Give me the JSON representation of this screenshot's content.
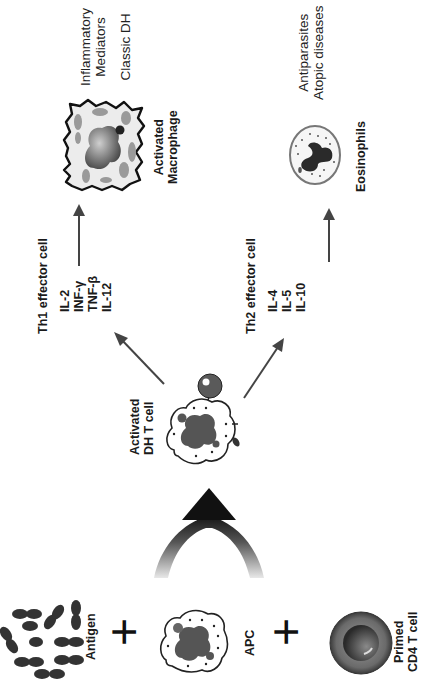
{
  "inputs": {
    "antigen_label": "Antigen",
    "apc_label": "APC",
    "primed_cell_label_line1": "Primed",
    "primed_cell_label_line2": "CD4 T cell",
    "plus_symbol": "+"
  },
  "activation": {
    "cell_label_line1": "Activated",
    "cell_label_line2": "DH T cell"
  },
  "th1": {
    "title": "Th1 effector cell",
    "cytokines": [
      "IL-2",
      "INF-γ",
      "TNF-β",
      "IL-12"
    ],
    "target_label_line1": "Activated",
    "target_label_line2": "Macrophage",
    "outcome_line1": "Inflammatory",
    "outcome_line2": "Mediators",
    "outcome_line3": "Classic DH"
  },
  "th2": {
    "title": "Th2 effector cell",
    "cytokines": [
      "IL-4",
      "IL-5",
      "IL-10"
    ],
    "target_label": "Eosinophils",
    "outcome_line1": "Antiparasites",
    "outcome_line2": "Atopic diseases"
  },
  "icons": {
    "antigen": "antigen-cluster-icon",
    "apc": "antigen-presenting-cell-icon",
    "primed_cell": "primed-cd4-t-cell-icon",
    "activated_cell": "activated-dh-t-cell-icon",
    "macrophage": "activated-macrophage-icon",
    "eosinophil": "eosinophil-icon",
    "merge_arrow": "merging-arrow-icon"
  },
  "colors": {
    "ink": "#1a1a1a",
    "nucleus_dark": "#3a3a3a",
    "nucleus_gray": "#6a6a6a",
    "cytoplasm_light": "#e6e6e6",
    "arrow": "#444444",
    "background": "#ffffff"
  }
}
